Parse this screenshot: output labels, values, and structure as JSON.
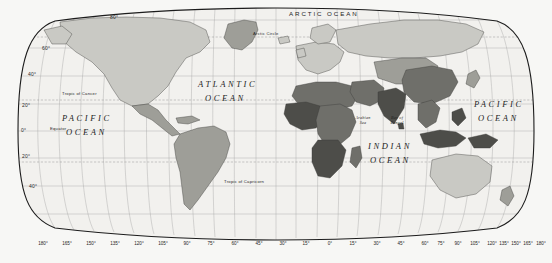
{
  "map": {
    "projection": "robinson",
    "title": "World Map",
    "colors": {
      "background": "#f7f7f5",
      "ocean": "#f2f1ee",
      "graticule": "#9a9a9a",
      "tropic_line": "#8c8c8c",
      "border": "#1c1c1c",
      "land_light": "#c9c9c4",
      "land_mid": "#9e9e98",
      "land_dark": "#6f6f6a",
      "land_darkest": "#4d4d49",
      "coast": "#3a3a38",
      "text": "#2b2b2b"
    }
  },
  "ocean_labels": [
    {
      "name": "arctic-ocean",
      "text": "ARCTIC OCEAN",
      "x": 289,
      "y": 14,
      "style": "ocean-arctic"
    },
    {
      "name": "atlantic-ocean-line1",
      "text": "ATLANTIC",
      "x": 198,
      "y": 84,
      "style": "ocean-major"
    },
    {
      "name": "atlantic-ocean-line2",
      "text": "OCEAN",
      "x": 205,
      "y": 98,
      "style": "ocean-major"
    },
    {
      "name": "pacific-ocean-west-line1",
      "text": "PACIFIC",
      "x": 62,
      "y": 118,
      "style": "ocean-major"
    },
    {
      "name": "pacific-ocean-west-line2",
      "text": "OCEAN",
      "x": 66,
      "y": 132,
      "style": "ocean-major"
    },
    {
      "name": "pacific-ocean-east-line1",
      "text": "PACIFIC",
      "x": 474,
      "y": 104,
      "style": "ocean-major"
    },
    {
      "name": "pacific-ocean-east-line2",
      "text": "OCEAN",
      "x": 478,
      "y": 118,
      "style": "ocean-major"
    },
    {
      "name": "indian-ocean-line1",
      "text": "INDIAN",
      "x": 368,
      "y": 146,
      "style": "ocean-major"
    },
    {
      "name": "indian-ocean-line2",
      "text": "OCEAN",
      "x": 370,
      "y": 160,
      "style": "ocean-major"
    }
  ],
  "sea_labels": [
    {
      "name": "arabian-sea",
      "text": "Arabian\nSea",
      "x": 357,
      "y": 119
    },
    {
      "name": "bay-of-bengal",
      "text": "Bay of\nBengal",
      "x": 391,
      "y": 119
    }
  ],
  "reference_lines": [
    {
      "name": "arctic-circle",
      "text": "Arctic Circle",
      "x": 253,
      "y": 35,
      "type": "dashed"
    },
    {
      "name": "tropic-of-cancer",
      "text": "Tropic of Cancer",
      "x": 62,
      "y": 95,
      "type": "dashed"
    },
    {
      "name": "equator",
      "text": "Equator",
      "x": 50,
      "y": 130,
      "type": "solid"
    },
    {
      "name": "tropic-of-capricorn",
      "text": "Tropic of Capricorn",
      "x": 224,
      "y": 183,
      "type": "dashed"
    }
  ],
  "latitude_labels": [
    {
      "name": "lat-80-north",
      "text": "80°",
      "x": 110,
      "y": 17
    },
    {
      "name": "lat-60-north",
      "text": "60°",
      "x": 42,
      "y": 49
    },
    {
      "name": "lat-40-north",
      "text": "40°",
      "x": 28,
      "y": 75
    },
    {
      "name": "lat-20-north",
      "text": "20°",
      "x": 22,
      "y": 106
    },
    {
      "name": "lat-0-equator",
      "text": "0°",
      "x": 21,
      "y": 131
    },
    {
      "name": "lat-20-south",
      "text": "20°",
      "x": 22,
      "y": 157
    },
    {
      "name": "lat-40-south",
      "text": "40°",
      "x": 29,
      "y": 187
    }
  ],
  "longitude_labels": [
    {
      "name": "lon-180-west",
      "text": "180°",
      "x": 43
    },
    {
      "name": "lon-165-west",
      "text": "165°",
      "x": 67
    },
    {
      "name": "lon-150-west",
      "text": "150°",
      "x": 91
    },
    {
      "name": "lon-135-west",
      "text": "135°",
      "x": 115
    },
    {
      "name": "lon-120-west",
      "text": "120°",
      "x": 139
    },
    {
      "name": "lon-105-west",
      "text": "105°",
      "x": 163
    },
    {
      "name": "lon-90-west",
      "text": "90°",
      "x": 187
    },
    {
      "name": "lon-75-west",
      "text": "75°",
      "x": 211
    },
    {
      "name": "lon-60-west",
      "text": "60°",
      "x": 235
    },
    {
      "name": "lon-45-west",
      "text": "45°",
      "x": 259
    },
    {
      "name": "lon-30-west",
      "text": "30°",
      "x": 283
    },
    {
      "name": "lon-15-west",
      "text": "15°",
      "x": 306
    },
    {
      "name": "lon-0-prime",
      "text": "0°",
      "x": 330
    },
    {
      "name": "lon-15-east",
      "text": "15°",
      "x": 353
    },
    {
      "name": "lon-30-east",
      "text": "30°",
      "x": 377
    },
    {
      "name": "lon-45-east",
      "text": "45°",
      "x": 401
    },
    {
      "name": "lon-60-east",
      "text": "60°",
      "x": 425
    },
    {
      "name": "lon-75-east",
      "text": "75°",
      "x": 449
    },
    {
      "name": "lon-90-east",
      "text": "90°",
      "x": 450
    },
    {
      "name": "lon-105-east",
      "text": "105°",
      "x": 463
    },
    {
      "name": "lon-120-east",
      "text": "120°",
      "x": 487
    },
    {
      "name": "lon-135-east",
      "text": "135°",
      "x": 496
    },
    {
      "name": "lon-150-east",
      "text": "150°",
      "x": 508
    },
    {
      "name": "lon-165-east",
      "text": "165°",
      "x": 520
    },
    {
      "name": "lon-180-east",
      "text": "180°",
      "x": 533
    }
  ],
  "graticule": {
    "parallels_deg": [
      80,
      60,
      40,
      20,
      0,
      -20,
      -40
    ],
    "meridians_deg": [
      -180,
      -165,
      -150,
      -135,
      -120,
      -105,
      -90,
      -75,
      -60,
      -45,
      -30,
      -15,
      0,
      15,
      30,
      45,
      60,
      75,
      90,
      105,
      120,
      135,
      150,
      165,
      180
    ],
    "meridian_spacing_deg": 15,
    "parallel_spacing_deg": 20
  }
}
